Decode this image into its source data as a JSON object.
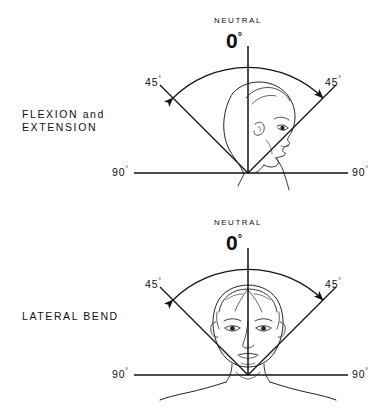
{
  "figure": {
    "title_visible": false,
    "background_color": "#ffffff",
    "ink_color": "#111111",
    "panels": [
      {
        "id": "flexion-extension",
        "name_lines": [
          "FLEXION and",
          "EXTENSION"
        ],
        "neutral_label": "NEUTRAL",
        "neutral_value": "0",
        "neutral_degree_symbol": "°",
        "left_angle_label": "45",
        "right_angle_label": "45",
        "left_baseline_label": "90",
        "right_baseline_label": "90",
        "degree_symbol": "°",
        "subject_view": "lateral-profile-facing-right",
        "arc_type": "double-headed-arc",
        "arc_span_degrees": 90,
        "range_each_side_degrees": 45,
        "baseline_total_degrees": 180
      },
      {
        "id": "lateral-bend",
        "name_lines": [
          "LATERAL BEND"
        ],
        "neutral_label": "NEUTRAL",
        "neutral_value": "0",
        "neutral_degree_symbol": "°",
        "left_angle_label": "45",
        "right_angle_label": "45",
        "left_baseline_label": "90",
        "right_baseline_label": "90",
        "degree_symbol": "°",
        "subject_view": "anterior-frontal-face-with-shoulders",
        "arc_type": "double-headed-arc",
        "arc_span_degrees": 90,
        "range_each_side_degrees": 45,
        "baseline_total_degrees": 180
      }
    ]
  }
}
